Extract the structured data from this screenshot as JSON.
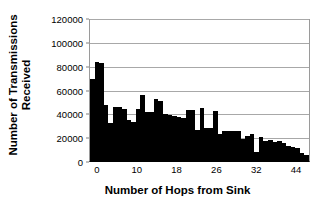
{
  "chart_data": {
    "type": "bar",
    "title": "",
    "xlabel": "Number of Hops from Sink",
    "ylabel_line1": "Number of Transmissions",
    "ylabel_line2": "Received",
    "ylabel": "Number of Transmissions Received",
    "ylim": [
      0,
      120000
    ],
    "ytick_labels": [
      "0",
      "20000",
      "40000",
      "60000",
      "80000",
      "100000",
      "120000"
    ],
    "ytick_values": [
      0,
      20000,
      40000,
      60000,
      80000,
      100000,
      120000
    ],
    "xtick_labels": [
      "0",
      "10",
      "18",
      "26",
      "32",
      "44"
    ],
    "xtick_positions": [
      0,
      10,
      18,
      26,
      32,
      44
    ],
    "grid": "horizontal",
    "legend": "none",
    "bar_color": "#000000",
    "categories": [
      0,
      1,
      2,
      3,
      4,
      5,
      6,
      7,
      8,
      9,
      10,
      11,
      12,
      13,
      14,
      15,
      16,
      17,
      18,
      19,
      20,
      21,
      22,
      23,
      24,
      25,
      26,
      27,
      28,
      29,
      30,
      31,
      32,
      33,
      34,
      35,
      36,
      37,
      38,
      39,
      40,
      41,
      42,
      43,
      44,
      45,
      46,
      47
    ],
    "values": [
      69000,
      84000,
      83000,
      47000,
      32000,
      46000,
      46000,
      44000,
      35000,
      33000,
      44000,
      56000,
      41000,
      41000,
      52000,
      51000,
      40000,
      39000,
      38000,
      37000,
      36000,
      43000,
      43000,
      26000,
      45000,
      28000,
      28000,
      42000,
      23000,
      25000,
      25000,
      25000,
      25000,
      19000,
      21000,
      23000,
      8000,
      20000,
      17000,
      18000,
      16000,
      17000,
      15000,
      13000,
      12000,
      11000,
      7000,
      5000
    ]
  }
}
